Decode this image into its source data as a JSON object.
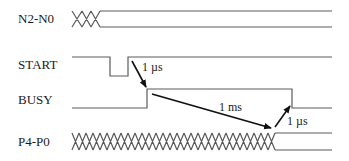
{
  "diagram": {
    "type": "timing-diagram",
    "signals": [
      {
        "id": "n2n0",
        "label": "N2-N0",
        "kind": "bus",
        "note": "undefined then stable"
      },
      {
        "id": "start",
        "label": "START",
        "kind": "digital",
        "note": "active-low pulse"
      },
      {
        "id": "busy",
        "label": "BUSY",
        "kind": "digital",
        "note": "high during conversion"
      },
      {
        "id": "p4p0",
        "label": "P4-P0",
        "kind": "bus",
        "note": "undefined then valid"
      }
    ],
    "annotations": [
      {
        "id": "t1",
        "label": "1 µs",
        "from": "START rising edge",
        "to": "BUSY rising edge"
      },
      {
        "id": "t2",
        "label": "1 ms",
        "from": "BUSY rising edge",
        "to": "P4-P0 valid"
      },
      {
        "id": "t3",
        "label": "1 µs",
        "from": "P4-P0 valid",
        "to": "BUSY falling edge"
      }
    ],
    "colors": {
      "waveform": "#5a5a5a",
      "arrow": "#111111",
      "text": "#1a1a1a",
      "background": "#ffffff"
    }
  }
}
